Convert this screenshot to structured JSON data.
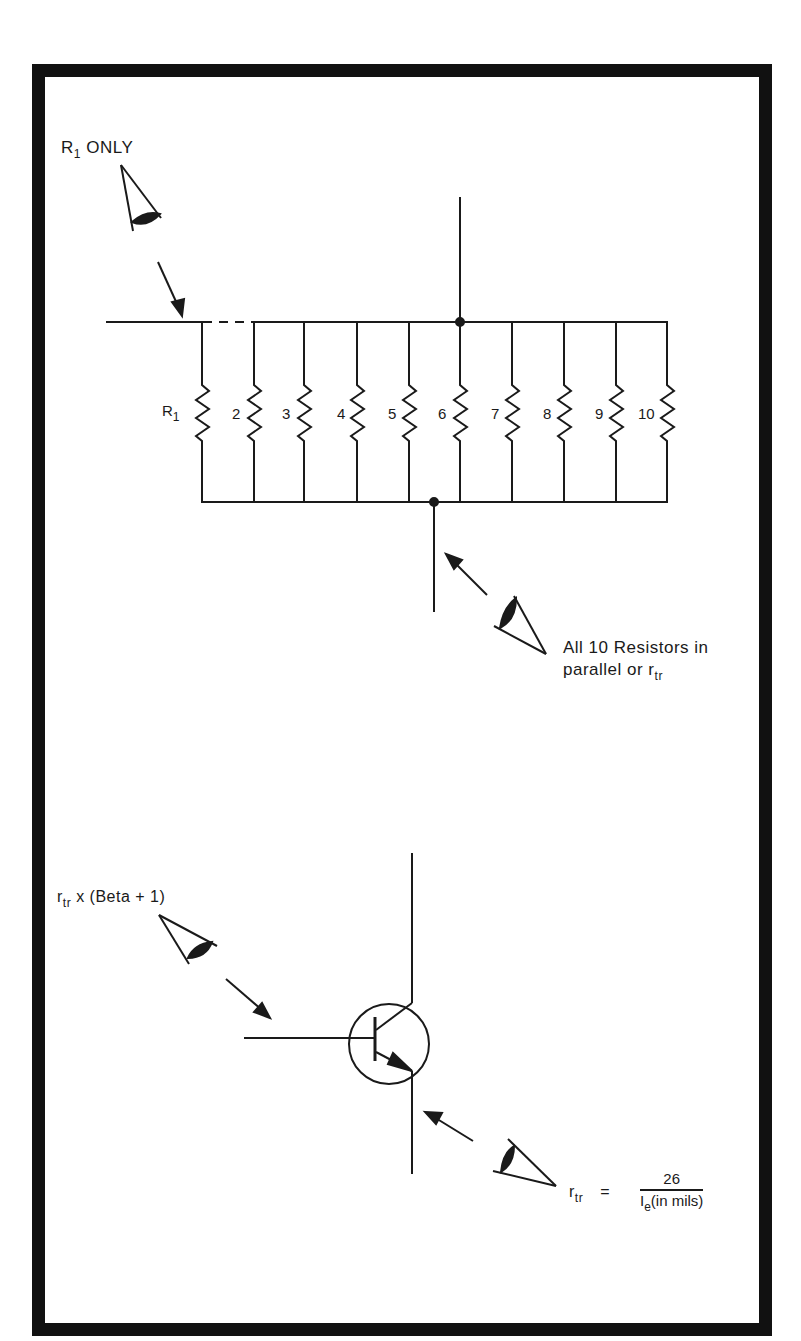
{
  "figure": {
    "type": "circuit-diagram",
    "top_section": {
      "viewpoint_r1": {
        "label_main": "R",
        "label_sub": "1",
        "label_rest": "ONLY"
      },
      "resistors": [
        {
          "label": "R",
          "sub": "1"
        },
        {
          "label": "2"
        },
        {
          "label": "3"
        },
        {
          "label": "4"
        },
        {
          "label": "5"
        },
        {
          "label": "6"
        },
        {
          "label": "7"
        },
        {
          "label": "8"
        },
        {
          "label": "9"
        },
        {
          "label": "10"
        }
      ],
      "viewpoint_parallel": {
        "line1": "All 10 Resistors in",
        "line2_main": "parallel or r",
        "line2_sub": "tr"
      }
    },
    "bottom_section": {
      "viewpoint_base": {
        "main": "r",
        "sub": "tr",
        "rest": "x (Beta + 1)"
      },
      "viewpoint_emitter": {
        "lhs_main": "r",
        "lhs_sub": "tr",
        "equals": "=",
        "numerator": "26",
        "denominator_main": "I",
        "denominator_sub": "e",
        "denominator_rest": "(in mils)"
      }
    },
    "colors": {
      "ink": "#1a1a1a",
      "border": "#111111",
      "background": "#ffffff"
    }
  }
}
